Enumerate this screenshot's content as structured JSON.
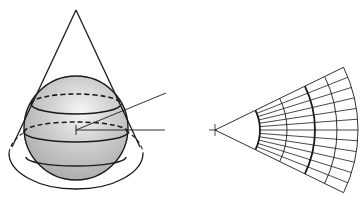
{
  "figure": {
    "colors": {
      "background": "#ffffff",
      "stroke": "#1a1a1a",
      "sphere_fill": "#bdbdbd",
      "sphere_highlight": "#f4f4f4"
    },
    "cone": {
      "apex": [
        76,
        10
      ],
      "base_center": [
        76,
        153
      ],
      "base_rx": 67,
      "base_ry": 36
    },
    "sphere": {
      "center": [
        76,
        128
      ],
      "radius": 52,
      "tangent_circle_y": 104,
      "tangent_circle_rx": 45,
      "tangent_circle_ry": 10,
      "lower_circle_y": 132,
      "lower_circle_rx": 52,
      "lower_circle_ry": 10,
      "equator_y": 157,
      "equator_rx": 50,
      "equator_ry": 9
    },
    "axes": {
      "origin": [
        76,
        130
      ],
      "oblique_end": [
        166,
        93
      ],
      "horizontal_end": [
        165,
        130
      ]
    },
    "fan": {
      "apex": [
        215,
        130
      ],
      "half_angle_deg": 26,
      "arc_radii": [
        45,
        72,
        100,
        122,
        143
      ],
      "bold_arc_indices": [
        0,
        2
      ],
      "meridian_count": 13
    }
  }
}
